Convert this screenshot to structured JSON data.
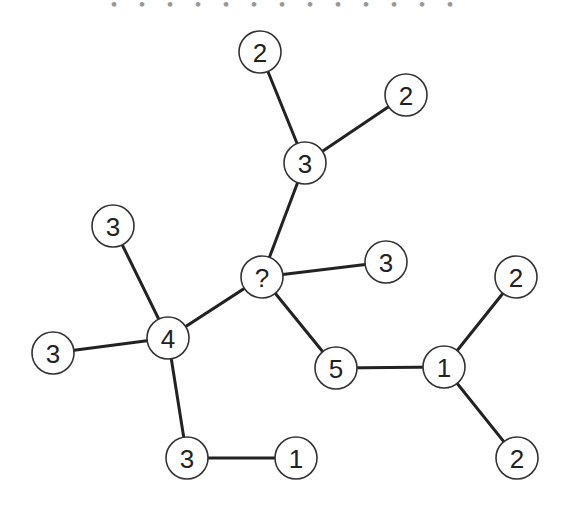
{
  "title_clipped": "・・・・・・・・・・・・・",
  "graph": {
    "node_radius": 21,
    "nodes": [
      {
        "id": "n1",
        "label": "2",
        "x": 260,
        "y": 52
      },
      {
        "id": "n2",
        "label": "2",
        "x": 406,
        "y": 95
      },
      {
        "id": "n3",
        "label": "3",
        "x": 305,
        "y": 163
      },
      {
        "id": "n4",
        "label": "3",
        "x": 113,
        "y": 226
      },
      {
        "id": "n5",
        "label": "?",
        "x": 262,
        "y": 277
      },
      {
        "id": "n6",
        "label": "3",
        "x": 386,
        "y": 262
      },
      {
        "id": "n7",
        "label": "2",
        "x": 516,
        "y": 277
      },
      {
        "id": "n8",
        "label": "3",
        "x": 53,
        "y": 353
      },
      {
        "id": "n9",
        "label": "4",
        "x": 168,
        "y": 338
      },
      {
        "id": "n10",
        "label": "5",
        "x": 336,
        "y": 368
      },
      {
        "id": "n11",
        "label": "1",
        "x": 444,
        "y": 367
      },
      {
        "id": "n12",
        "label": "3",
        "x": 187,
        "y": 458
      },
      {
        "id": "n13",
        "label": "1",
        "x": 296,
        "y": 458
      },
      {
        "id": "n14",
        "label": "2",
        "x": 517,
        "y": 458
      }
    ],
    "edges": [
      [
        "n1",
        "n3"
      ],
      [
        "n2",
        "n3"
      ],
      [
        "n3",
        "n5"
      ],
      [
        "n5",
        "n6"
      ],
      [
        "n5",
        "n9"
      ],
      [
        "n5",
        "n10"
      ],
      [
        "n4",
        "n9"
      ],
      [
        "n8",
        "n9"
      ],
      [
        "n9",
        "n12"
      ],
      [
        "n12",
        "n13"
      ],
      [
        "n10",
        "n11"
      ],
      [
        "n11",
        "n7"
      ],
      [
        "n11",
        "n14"
      ]
    ]
  }
}
